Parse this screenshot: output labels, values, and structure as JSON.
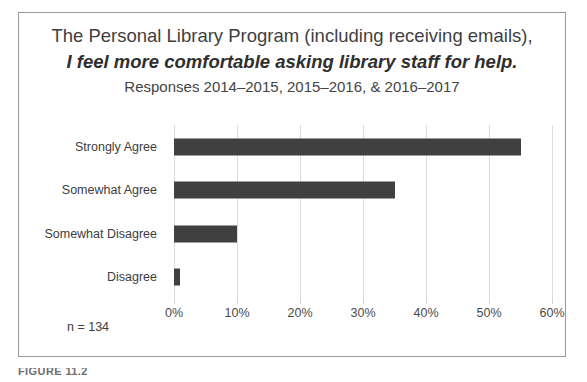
{
  "figure": {
    "caption_partial": "FIGURE 11.2",
    "footnote": "n = 134"
  },
  "chart_data": {
    "type": "bar",
    "orientation": "horizontal",
    "title": "The Personal Library Program (including receiving emails),",
    "title_emphasis": "I feel more comfortable asking library staff for help.",
    "subtitle": "Responses 2014–2015, 2015–2016, & 2016–2017",
    "categories": [
      "Strongly Agree",
      "Somewhat Agree",
      "Somewhat Disagree",
      "Disagree"
    ],
    "values": [
      55,
      35,
      10,
      1
    ],
    "tick_labels": [
      "0%",
      "10%",
      "20%",
      "30%",
      "40%",
      "50%",
      "60%"
    ],
    "tick_values": [
      0,
      10,
      20,
      30,
      40,
      50,
      60
    ],
    "xlabel": "",
    "ylabel": "",
    "xlim": [
      0,
      60
    ],
    "grid": "vertical",
    "legend": "none",
    "bar_color": "#404040",
    "gridline_color": "#dcdcdc",
    "sample_size": 134
  }
}
